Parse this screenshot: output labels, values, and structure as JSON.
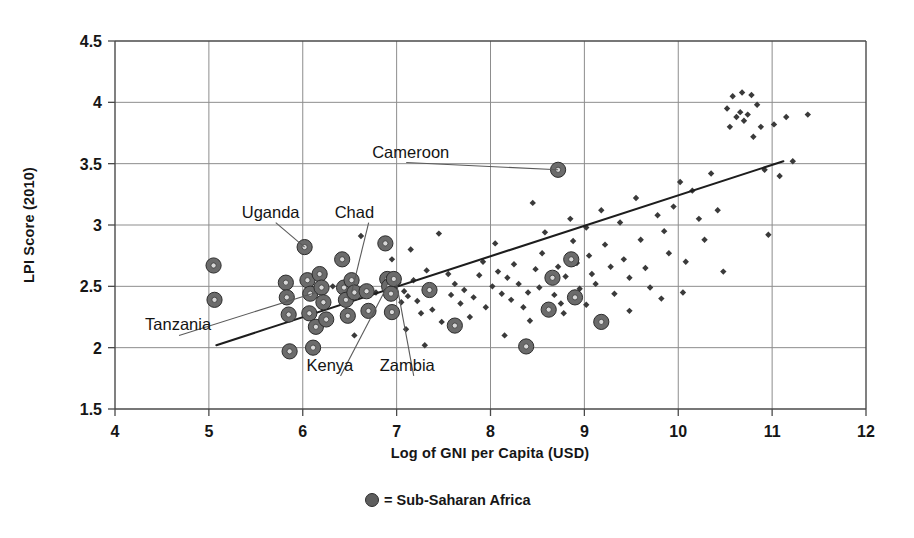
{
  "chart_data": {
    "type": "scatter",
    "title": "",
    "xlabel": "Log of GNI per Capita (USD)",
    "ylabel": "LPI Score (2010)",
    "xlim": [
      4,
      12
    ],
    "ylim": [
      1.5,
      4.5
    ],
    "xticks": [
      "4",
      "5",
      "6",
      "7",
      "8",
      "9",
      "10",
      "11",
      "12"
    ],
    "yticks": [
      "1.5",
      "2",
      "2.5",
      "3",
      "3.5",
      "4",
      "4.5"
    ],
    "grid": true,
    "legend_position": "below-axis",
    "legend": [
      {
        "marker": "filled-circle",
        "label": "= Sub-Saharan Africa"
      }
    ],
    "series": [
      {
        "name": "Sub-Saharan Africa",
        "marker": "large-ringed-circle",
        "color": "#6b6b6b",
        "points": [
          [
            5.05,
            2.67
          ],
          [
            5.06,
            2.39
          ],
          [
            5.82,
            2.53
          ],
          [
            5.83,
            2.41
          ],
          [
            5.85,
            2.27
          ],
          [
            5.86,
            1.97
          ],
          [
            6.02,
            2.82
          ],
          [
            6.05,
            2.55
          ],
          [
            6.08,
            2.44
          ],
          [
            6.07,
            2.28
          ],
          [
            6.11,
            2.0
          ],
          [
            6.14,
            2.17
          ],
          [
            6.18,
            2.6
          ],
          [
            6.2,
            2.49
          ],
          [
            6.22,
            2.37
          ],
          [
            6.25,
            2.23
          ],
          [
            6.42,
            2.72
          ],
          [
            6.44,
            2.49
          ],
          [
            6.46,
            2.39
          ],
          [
            6.48,
            2.26
          ],
          [
            6.52,
            2.55
          ],
          [
            6.55,
            2.45
          ],
          [
            6.68,
            2.46
          ],
          [
            6.7,
            2.3
          ],
          [
            6.88,
            2.85
          ],
          [
            6.9,
            2.56
          ],
          [
            6.92,
            2.5
          ],
          [
            6.94,
            2.44
          ],
          [
            6.95,
            2.29
          ],
          [
            6.97,
            2.56
          ],
          [
            7.35,
            2.47
          ],
          [
            7.62,
            2.18
          ],
          [
            8.38,
            2.01
          ],
          [
            8.62,
            2.31
          ],
          [
            8.66,
            2.57
          ],
          [
            8.72,
            3.45
          ],
          [
            8.86,
            2.72
          ],
          [
            8.9,
            2.41
          ],
          [
            9.18,
            2.21
          ]
        ]
      },
      {
        "name": "Other countries",
        "marker": "small-diamond",
        "color": "#3a3a3a",
        "points": [
          [
            6.32,
            2.5
          ],
          [
            6.62,
            2.91
          ],
          [
            6.78,
            2.45
          ],
          [
            7.02,
            2.53
          ],
          [
            7.05,
            2.37
          ],
          [
            7.08,
            2.46
          ],
          [
            7.12,
            2.42
          ],
          [
            7.18,
            2.55
          ],
          [
            7.22,
            2.38
          ],
          [
            7.26,
            2.28
          ],
          [
            7.32,
            2.63
          ],
          [
            7.38,
            2.31
          ],
          [
            7.45,
            2.93
          ],
          [
            7.48,
            2.21
          ],
          [
            7.55,
            2.6
          ],
          [
            7.58,
            2.43
          ],
          [
            7.62,
            2.52
          ],
          [
            7.68,
            2.36
          ],
          [
            7.72,
            2.47
          ],
          [
            7.78,
            2.25
          ],
          [
            7.82,
            2.41
          ],
          [
            7.88,
            2.59
          ],
          [
            7.92,
            2.7
          ],
          [
            7.95,
            2.33
          ],
          [
            8.02,
            2.5
          ],
          [
            8.05,
            2.85
          ],
          [
            8.08,
            2.62
          ],
          [
            8.12,
            2.44
          ],
          [
            8.18,
            2.57
          ],
          [
            8.22,
            2.39
          ],
          [
            8.25,
            2.68
          ],
          [
            8.3,
            2.52
          ],
          [
            8.35,
            2.33
          ],
          [
            8.4,
            2.45
          ],
          [
            8.45,
            3.18
          ],
          [
            8.48,
            2.64
          ],
          [
            8.52,
            2.49
          ],
          [
            8.55,
            2.77
          ],
          [
            8.58,
            2.94
          ],
          [
            8.62,
            2.55
          ],
          [
            8.68,
            2.43
          ],
          [
            8.72,
            2.66
          ],
          [
            8.75,
            2.36
          ],
          [
            8.8,
            2.58
          ],
          [
            8.85,
            3.05
          ],
          [
            8.88,
            2.87
          ],
          [
            8.92,
            2.69
          ],
          [
            8.95,
            2.48
          ],
          [
            9.02,
            2.98
          ],
          [
            9.05,
            2.75
          ],
          [
            9.08,
            2.6
          ],
          [
            9.12,
            2.52
          ],
          [
            9.18,
            3.12
          ],
          [
            9.22,
            2.84
          ],
          [
            9.28,
            2.66
          ],
          [
            9.32,
            2.44
          ],
          [
            9.38,
            3.02
          ],
          [
            9.42,
            2.72
          ],
          [
            9.48,
            2.57
          ],
          [
            9.55,
            3.22
          ],
          [
            9.6,
            2.88
          ],
          [
            9.65,
            2.65
          ],
          [
            9.7,
            2.49
          ],
          [
            9.78,
            3.08
          ],
          [
            9.85,
            2.95
          ],
          [
            9.9,
            2.77
          ],
          [
            9.95,
            3.15
          ],
          [
            10.02,
            3.35
          ],
          [
            10.08,
            2.7
          ],
          [
            10.15,
            3.28
          ],
          [
            10.22,
            3.05
          ],
          [
            10.28,
            2.88
          ],
          [
            10.35,
            3.42
          ],
          [
            10.42,
            3.12
          ],
          [
            10.48,
            2.62
          ],
          [
            10.52,
            3.95
          ],
          [
            10.55,
            3.8
          ],
          [
            10.58,
            4.05
          ],
          [
            10.62,
            3.88
          ],
          [
            10.66,
            3.92
          ],
          [
            10.68,
            4.08
          ],
          [
            10.7,
            3.85
          ],
          [
            10.74,
            3.9
          ],
          [
            10.78,
            4.06
          ],
          [
            10.8,
            3.72
          ],
          [
            10.84,
            3.98
          ],
          [
            10.88,
            3.8
          ],
          [
            10.92,
            3.45
          ],
          [
            10.96,
            2.92
          ],
          [
            11.02,
            3.82
          ],
          [
            11.08,
            3.4
          ],
          [
            11.15,
            3.88
          ],
          [
            11.22,
            3.52
          ],
          [
            11.38,
            3.9
          ],
          [
            6.55,
            2.1
          ],
          [
            7.1,
            2.15
          ],
          [
            7.3,
            2.02
          ],
          [
            8.15,
            2.1
          ],
          [
            8.42,
            2.22
          ],
          [
            8.78,
            2.28
          ],
          [
            9.02,
            2.35
          ],
          [
            9.48,
            2.3
          ],
          [
            9.82,
            2.4
          ],
          [
            10.05,
            2.45
          ],
          [
            6.95,
            2.72
          ],
          [
            7.15,
            2.8
          ]
        ]
      }
    ],
    "trendline": {
      "x_start": 5.08,
      "y_start": 2.02,
      "x_end": 11.12,
      "y_end": 3.52,
      "color": "#1d1d1d"
    },
    "annotations": [
      {
        "label": "Uganda",
        "label_x": 5.35,
        "label_y": 3.06,
        "point_x": 6.02,
        "point_y": 2.82
      },
      {
        "label": "Chad",
        "label_x": 6.34,
        "label_y": 3.06,
        "point_x": 6.52,
        "point_y": 2.45
      },
      {
        "label": "Cameroon",
        "label_x": 6.74,
        "label_y": 3.55,
        "point_x": 8.72,
        "point_y": 3.45
      },
      {
        "label": "Tanzania",
        "label_x": 4.32,
        "label_y": 2.14,
        "point_x": 6.14,
        "point_y": 2.45
      },
      {
        "label": "Kenya",
        "label_x": 6.04,
        "label_y": 1.81,
        "point_x": 6.9,
        "point_y": 2.5
      },
      {
        "label": "Zambia",
        "label_x": 6.82,
        "label_y": 1.81,
        "point_x": 7.0,
        "point_y": 2.52
      }
    ]
  }
}
